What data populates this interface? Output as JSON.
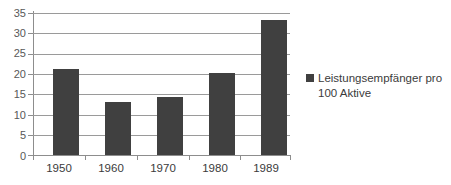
{
  "chart_data": {
    "type": "bar",
    "title": "",
    "subtitle": "",
    "xlabel": "",
    "ylabel": "",
    "categories": [
      "1950",
      "1960",
      "1970",
      "1980",
      "1989"
    ],
    "series": [
      {
        "name": "Leistungsempfänger pro 100 Aktive",
        "values": [
          21.2,
          13.0,
          14.4,
          20.3,
          33.3
        ],
        "color": "#404040"
      }
    ],
    "ylim": [
      0,
      35
    ],
    "ytick_values": [
      0,
      5,
      10,
      15,
      20,
      25,
      30,
      35
    ],
    "ytick_labels": [
      "0",
      "5",
      "10",
      "15",
      "20",
      "25",
      "30",
      "35"
    ],
    "grid": true,
    "grid_axis": "y",
    "legend": {
      "position": "right",
      "entries": [
        {
          "line1": "Leistungsempfänger pro",
          "line2": "100 Aktive",
          "marker": "square-marker",
          "color": "#404040"
        }
      ]
    },
    "background_color": "#ffffff",
    "axis_color": "#8d8d8d",
    "gridline_color": "#9a9a9a",
    "tick_label_color": "#585858"
  }
}
